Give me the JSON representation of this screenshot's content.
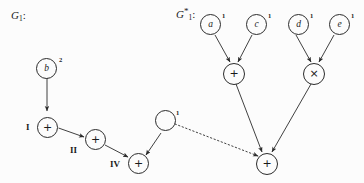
{
  "figure": {
    "width": 364,
    "height": 183,
    "background": "#fcfcfc",
    "ink": "#2b2b2b"
  },
  "graphs": [
    {
      "id": "G1",
      "label_base": "G",
      "label_sub": "1",
      "label_star": "",
      "label_colon": ":",
      "label_text": "G1:"
    },
    {
      "id": "G1star",
      "label_base": "G",
      "label_sub": "1",
      "label_star": "*",
      "label_colon": ":",
      "label_text": "G1*:"
    }
  ],
  "nodes": {
    "b": {
      "glyph": "b",
      "superscript": "2",
      "roman": ""
    },
    "g1_I": {
      "glyph": "+",
      "superscript": "",
      "roman": "I"
    },
    "g1_II": {
      "glyph": "+",
      "superscript": "",
      "roman": "II"
    },
    "g1_III": {
      "glyph": "",
      "superscript": "1",
      "roman": ""
    },
    "g1_IV": {
      "glyph": "+",
      "superscript": "",
      "roman": "IV"
    },
    "a": {
      "glyph": "a",
      "superscript": "1",
      "roman": ""
    },
    "c": {
      "glyph": "c",
      "superscript": "1",
      "roman": ""
    },
    "d": {
      "glyph": "d",
      "superscript": "1",
      "roman": ""
    },
    "e": {
      "glyph": "e",
      "superscript": "1",
      "roman": ""
    },
    "plus_ac": {
      "glyph": "+",
      "superscript": "",
      "roman": ""
    },
    "times_de": {
      "glyph": "×",
      "superscript": "",
      "roman": ""
    },
    "plus_root": {
      "glyph": "+",
      "superscript": "",
      "roman": ""
    }
  },
  "edges": [
    {
      "from": "b",
      "to": "g1_I",
      "style": "solid"
    },
    {
      "from": "g1_I",
      "to": "g1_II",
      "style": "solid"
    },
    {
      "from": "g1_II",
      "to": "g1_IV",
      "style": "solid"
    },
    {
      "from": "g1_III",
      "to": "g1_IV",
      "style": "solid"
    },
    {
      "from": "g1_III",
      "to": "plus_root",
      "style": "dotted"
    },
    {
      "from": "a",
      "to": "plus_ac",
      "style": "solid"
    },
    {
      "from": "c",
      "to": "plus_ac",
      "style": "solid"
    },
    {
      "from": "d",
      "to": "times_de",
      "style": "solid"
    },
    {
      "from": "e",
      "to": "times_de",
      "style": "solid"
    },
    {
      "from": "plus_ac",
      "to": "plus_root",
      "style": "solid"
    },
    {
      "from": "times_de",
      "to": "plus_root",
      "style": "solid"
    }
  ]
}
